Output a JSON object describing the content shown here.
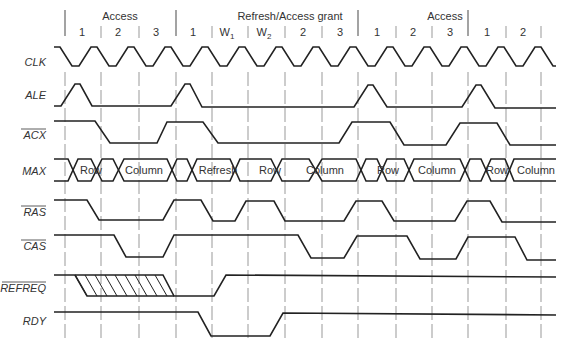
{
  "diagram": {
    "groups": [
      {
        "label": "Access",
        "x": 120
      },
      {
        "label": "Refresh/Access grant",
        "x": 280
      },
      {
        "label": "Access",
        "x": 432
      },
      {
        "label": "",
        "x": 520
      }
    ],
    "cycles": [
      "1",
      "2",
      "3",
      "1",
      "W",
      "W",
      "2",
      "3",
      "1",
      "2",
      "3",
      "1",
      "2"
    ],
    "cycle_subscripts": [
      "",
      "",
      "",
      "",
      "1",
      "2",
      "",
      "",
      "",
      "",
      "",
      "",
      ""
    ],
    "signals": [
      {
        "name": "CLK",
        "overbar": false
      },
      {
        "name": "ALE",
        "overbar": false
      },
      {
        "name": "ACX",
        "overbar": true
      },
      {
        "name": "MAX",
        "overbar": false
      },
      {
        "name": "RAS",
        "overbar": true
      },
      {
        "name": "CAS",
        "overbar": true
      },
      {
        "name": "REFREQ",
        "overbar": true
      },
      {
        "name": "RDY",
        "overbar": false
      }
    ],
    "bus_values": [
      "Row",
      "Column",
      "Refresh",
      "Row",
      "Column",
      "Row",
      "Column",
      "Row",
      "Column"
    ]
  }
}
